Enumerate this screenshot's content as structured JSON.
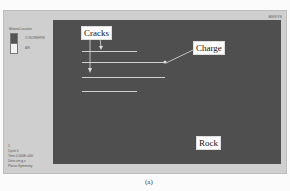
{
  "window": {
    "logo_text": "ANSYS",
    "legend": {
      "title": "Material Location",
      "items": [
        {
          "label": "CONCRBHPM",
          "color": "#555555"
        },
        {
          "label": "AIR",
          "color": "#f3f3f3"
        }
      ]
    },
    "info_lines": [
      "1",
      "Cycle 0",
      "Time 0.000E+000",
      "Units cm,g,s",
      "Planar Symmetry"
    ]
  },
  "annotations": {
    "cracks_label": "Cracks",
    "charge_label": "Charge",
    "rock_label": "Rock"
  },
  "caption": "(a)",
  "colors": {
    "rock": "#4f4f4f",
    "background_panel": "#cfcfcf",
    "crack_lines": "#cfcfcf"
  }
}
